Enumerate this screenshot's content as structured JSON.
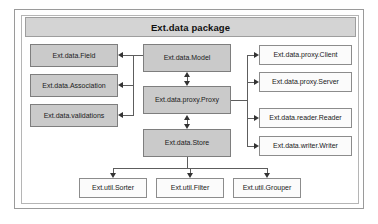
{
  "diagram": {
    "title": "Ext.data package",
    "nodes": {
      "field": "Ext.data.Field",
      "association": "Ext.data.Association",
      "validations": "Ext.data.validations",
      "model": "Ext.data.Model",
      "proxy": "Ext.data.proxy.Proxy",
      "store": "Ext.data.Store",
      "proxy_client": "Ext.data.proxy.Client",
      "proxy_server": "Ext.data.proxy.Server",
      "reader": "Ext.data.reader.Reader",
      "writer": "Ext.data.writer.Writer",
      "sorter": "Ext.util.Sorter",
      "filter": "Ext.util.Filter",
      "grouper": "Ext.util.Grouper"
    },
    "colors": {
      "core_fill": "#cacaca",
      "leaf_fill": "#fbfbfb",
      "title_fill": "#d4d4d4",
      "border": "#8c8c8c",
      "connector": "#5d5d5d"
    }
  }
}
